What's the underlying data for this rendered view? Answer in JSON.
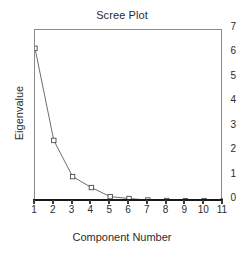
{
  "chart_data": {
    "type": "line",
    "title": "Scree Plot",
    "xlabel": "Component Number",
    "ylabel": "Eigenvalue",
    "x": [
      1,
      2,
      3,
      4,
      5,
      6,
      7,
      8,
      9,
      10,
      11
    ],
    "values": [
      6.25,
      2.48,
      1.0,
      0.55,
      0.18,
      0.1,
      0.04,
      0.02,
      0.01,
      0.01,
      0.0
    ],
    "series": [
      {
        "name": "Eigenvalue",
        "values": [
          6.25,
          2.48,
          1.0,
          0.55,
          0.18,
          0.1,
          0.04,
          0.02,
          0.01,
          0.01,
          0.0
        ]
      }
    ],
    "xlim": [
      1,
      11
    ],
    "ylim": [
      0,
      7
    ],
    "xticks": [
      "1",
      "2",
      "3",
      "4",
      "5",
      "6",
      "7",
      "8",
      "9",
      "10",
      "11"
    ],
    "yticks": [
      "0",
      "1",
      "2",
      "3",
      "4",
      "5",
      "6",
      "7"
    ],
    "grid": false,
    "legend": false,
    "marker": "open-square",
    "line_color": "#6e6e6e",
    "marker_edge_color": "#4a4a4a",
    "marker_face_color": "#ffffff",
    "axis_color": "#1a1a1a",
    "frame_color": "#8a8a8a",
    "background": "#ffffff"
  }
}
